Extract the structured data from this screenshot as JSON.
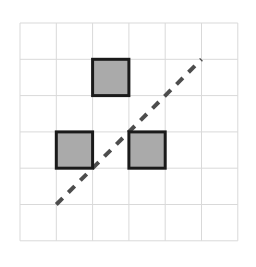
{
  "figure": {
    "title": "",
    "canvas": {
      "width": 256,
      "height": 267,
      "background": "#ffffff"
    },
    "grid": {
      "origin_x": 20,
      "origin_y": 23,
      "cell_size": 36.3,
      "columns": 6,
      "rows": 6,
      "line_color": "#d9d9d9",
      "line_width": 1,
      "visible": true
    },
    "squares": {
      "fill_color": "#aaaaaa",
      "stroke_color": "#1a1a1a",
      "stroke_width": 3,
      "size_in_cells": 1,
      "items": [
        {
          "name": "top-square",
          "col": 2,
          "row": 1
        },
        {
          "name": "left-square",
          "col": 1,
          "row": 3
        },
        {
          "name": "right-square",
          "col": 3,
          "row": 3
        }
      ]
    },
    "diagonal_line": {
      "name": "dashed-diagonal",
      "start_col": 1,
      "start_row": 5,
      "end_col": 5,
      "end_row": 1,
      "color": "#4d4d4d",
      "width": 4,
      "dash_pattern": "9 8",
      "style": "dashed"
    }
  }
}
